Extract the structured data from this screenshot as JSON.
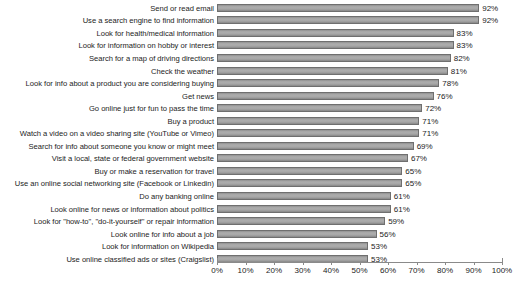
{
  "chart_data": {
    "type": "bar",
    "orientation": "horizontal",
    "title": "",
    "subtitle": "",
    "xlabel": "",
    "ylabel": "",
    "xlim": [
      0,
      100
    ],
    "xtick_step": 10,
    "grid": false,
    "legend": null,
    "value_suffix": "%",
    "bar_color": "#a6a6a6",
    "bar_edge_color": "#6f6f6f",
    "axis_color": "#8a8a8a",
    "text_color": "#1c1c1c",
    "xticks": [
      {
        "value": 0,
        "label": "0%"
      },
      {
        "value": 10,
        "label": "10%"
      },
      {
        "value": 20,
        "label": "20%"
      },
      {
        "value": 30,
        "label": "30%"
      },
      {
        "value": 40,
        "label": "40%"
      },
      {
        "value": 50,
        "label": "50%"
      },
      {
        "value": 60,
        "label": "60%"
      },
      {
        "value": 70,
        "label": "70%"
      },
      {
        "value": 80,
        "label": "80%"
      },
      {
        "value": 90,
        "label": "90%"
      },
      {
        "value": 100,
        "label": "100%"
      }
    ],
    "categories": [
      "Send or read email",
      "Use a search engine to find information",
      "Look for health/medical information",
      "Look for information on hobby or interest",
      "Search for a map of driving directions",
      "Check the weather",
      "Look for info about a product you are considering buying",
      "Get news",
      "Go online just for fun to pass the time",
      "Buy a product",
      "Watch a video on a video sharing site (YouTube or Vimeo)",
      "Search for info about someone you know or might meet",
      "Visit a local, state or federal government website",
      "Buy or make a reservation for travel",
      "Use an online social networking site (Facebook or Linkedin)",
      "Do any banking online",
      "Look online for news or information about politics",
      "Look for \"how-to\", \"do-it-yourself\" or repair information",
      "Look online for info about a job",
      "Look for information on Wikipedia",
      "Use online classified ads or sites (Craigslist)"
    ],
    "values": [
      92,
      92,
      83,
      83,
      82,
      81,
      78,
      76,
      72,
      71,
      71,
      69,
      67,
      65,
      65,
      61,
      61,
      59,
      56,
      53,
      53
    ],
    "value_labels": [
      "92%",
      "92%",
      "83%",
      "83%",
      "82%",
      "81%",
      "78%",
      "76%",
      "72%",
      "71%",
      "71%",
      "69%",
      "67%",
      "65%",
      "65%",
      "61%",
      "61%",
      "59%",
      "56%",
      "53%",
      "53%"
    ]
  }
}
